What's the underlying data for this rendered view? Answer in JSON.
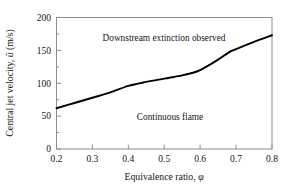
{
  "chart_data": {
    "type": "line",
    "title": "",
    "subtitle": "",
    "xlabel_text": "Equivalence  ratio, ",
    "xlabel_symbol": "φ",
    "ylabel_text": "Central jet velocity,  ",
    "ylabel_symbol": "ū",
    "ylabel_units": " (m/s)",
    "xlim": [
      0.2,
      0.8
    ],
    "ylim": [
      0,
      200
    ],
    "xticks": [
      0.2,
      0.3,
      0.4,
      0.5,
      0.6,
      0.7,
      0.8
    ],
    "xtick_labels": [
      "0.2",
      "0.3",
      "0.4",
      "0.5",
      "0.6",
      "0.7",
      "0.8"
    ],
    "yticks": [
      0,
      50,
      100,
      150,
      200
    ],
    "ytick_labels": [
      "0",
      "50",
      "100",
      "150",
      "200"
    ],
    "grid": false,
    "legend": "none",
    "series": [
      {
        "name": "Extinction boundary",
        "color": "#000000",
        "x": [
          0.2,
          0.25,
          0.3,
          0.35,
          0.4,
          0.45,
          0.5,
          0.55,
          0.58,
          0.6,
          0.62,
          0.65,
          0.68,
          0.7,
          0.75,
          0.8
        ],
        "values": [
          62,
          70,
          78,
          86,
          96,
          102,
          107,
          112,
          116,
          120,
          126,
          136,
          147,
          152,
          163,
          173
        ]
      }
    ],
    "annotations": [
      {
        "name": "upper-region-label",
        "text": "Downstream extinction observed",
        "x": 0.41,
        "y": 178
      },
      {
        "name": "lower-region-label",
        "text": "Continuous flame",
        "x": 0.5,
        "y": 58
      }
    ]
  },
  "axes_style": {
    "frame_color": "#8d8d8d",
    "curve_color": "#000000",
    "background": "#ffffff"
  }
}
